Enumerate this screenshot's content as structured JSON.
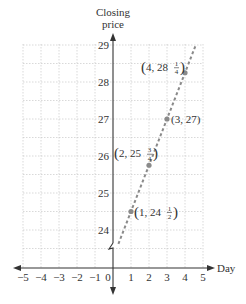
{
  "chart_data": {
    "type": "line",
    "title": "",
    "xlabel": "Day",
    "ylabel": "Closing price",
    "ylabel_lines": [
      "Closing",
      "price"
    ],
    "xlim": [
      -5,
      5
    ],
    "ylim": [
      24,
      29
    ],
    "y_axis_break": true,
    "grid": true,
    "x_ticks": [
      "−5",
      "−4",
      "−3",
      "−2",
      "−1",
      "0",
      "1",
      "2",
      "3",
      "4",
      "5"
    ],
    "x_tick_values": [
      -5,
      -4,
      -3,
      -2,
      -1,
      0,
      1,
      2,
      3,
      4,
      5
    ],
    "y_ticks": [
      "24",
      "25",
      "26",
      "27",
      "28",
      "29"
    ],
    "y_tick_values": [
      24,
      25,
      26,
      27,
      28,
      29
    ],
    "series": [
      {
        "name": "closing price trend",
        "style": "dashed",
        "color": "#8a8a8a",
        "line": {
          "slope": 1.25,
          "intercept": 23.25,
          "x_start": 0.3,
          "x_end": 4.6
        },
        "points": [
          {
            "x": 1,
            "y": 24.5,
            "label_main": "(1, 24",
            "label_num": "1",
            "label_den": "2"
          },
          {
            "x": 2,
            "y": 25.75,
            "label_main": "(2, 25",
            "label_num": "3",
            "label_den": "4"
          },
          {
            "x": 3,
            "y": 27,
            "label_main": "(3, 27)",
            "label_num": "",
            "label_den": ""
          },
          {
            "x": 4,
            "y": 28.25,
            "label_main": "(4, 28",
            "label_num": "1",
            "label_den": "4"
          }
        ]
      }
    ]
  },
  "colors": {
    "axis": "#333333",
    "grid": "#c8c8c8",
    "series": "#8a8a8a",
    "text": "#333333"
  }
}
